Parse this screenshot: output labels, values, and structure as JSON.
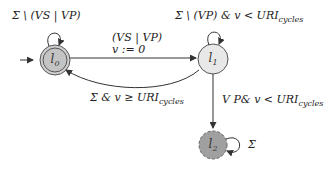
{
  "diagram": {
    "type": "timed-automaton",
    "states": [
      {
        "id": "l0",
        "label": "l",
        "index": "0",
        "initial": true,
        "accepting": true,
        "fill": "#c8c8c8"
      },
      {
        "id": "l1",
        "label": "l",
        "index": "1",
        "initial": false,
        "accepting": false,
        "fill": "#e6e6e6"
      },
      {
        "id": "l2",
        "label": "l",
        "index": "2",
        "initial": false,
        "accepting": false,
        "dashed": true,
        "fill": "#9a9a9a"
      }
    ],
    "transitions": [
      {
        "from": "l0",
        "to": "l0",
        "guard": "Σ \\ (VS | VP)"
      },
      {
        "from": "l0",
        "to": "l1",
        "guard": "(VS | VP)",
        "update": "v := 0"
      },
      {
        "from": "l1",
        "to": "l1",
        "guard_main": "Σ \\ (VP) & v < URI",
        "guard_sub": "cycles"
      },
      {
        "from": "l1",
        "to": "l0",
        "guard_main": "Σ & v ≥ URI",
        "guard_sub": "cycles"
      },
      {
        "from": "l1",
        "to": "l2",
        "guard_main": "V P& v < URI",
        "guard_sub": "cycles"
      },
      {
        "from": "l2",
        "to": "l2",
        "guard": "Σ"
      }
    ]
  }
}
